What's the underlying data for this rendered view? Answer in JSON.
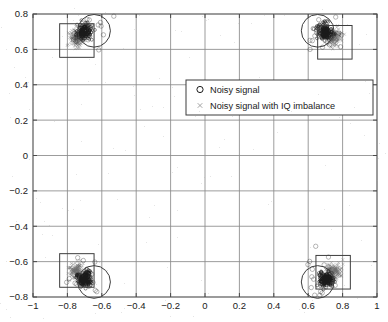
{
  "chart_data": {
    "type": "scatter",
    "title": "",
    "xlabel": "",
    "ylabel": "",
    "xlim": [
      -1,
      1
    ],
    "ylim": [
      -0.8,
      0.8
    ],
    "grid": true,
    "xticks": [
      -1,
      -0.8,
      -0.6,
      -0.4,
      -0.2,
      0,
      0.2,
      0.4,
      0.6,
      0.8,
      1
    ],
    "xticklabels": [
      "-1",
      "-0.8",
      "-0.6",
      "-0.4",
      "-0.2",
      "0",
      "0.2",
      "0.4",
      "0.6",
      "0.8",
      "1"
    ],
    "yticks": [
      -0.8,
      -0.6,
      -0.4,
      -0.2,
      0,
      0.2,
      0.4,
      0.6,
      0.8
    ],
    "yticklabels": [
      "-0.8",
      "-0.6",
      "-0.4",
      "-0.2",
      "0",
      "0.2",
      "0.4",
      "0.6",
      "0.8"
    ],
    "legend": {
      "position": "upper-center-right",
      "entries": [
        {
          "label": "Noisy signal",
          "marker": "circle",
          "color": "#1a1a1a"
        },
        {
          "label": "Noisy signal with IQ imbalance",
          "marker": "x",
          "color": "#1a1a1a"
        }
      ]
    },
    "series": [
      {
        "name": "Noisy signal",
        "marker": "circle",
        "color": "#1a1a1a",
        "constellation_centers": [
          {
            "x": -0.7,
            "y": 0.7
          },
          {
            "x": 0.7,
            "y": 0.7
          },
          {
            "x": -0.7,
            "y": -0.7
          },
          {
            "x": 0.7,
            "y": -0.7
          }
        ],
        "cluster_radius": 0.065,
        "points_per_cluster": 180
      },
      {
        "name": "Noisy signal with IQ imbalance",
        "marker": "x",
        "color": "#6f6f6f",
        "constellation_centers": [
          {
            "x": -0.745,
            "y": 0.665
          },
          {
            "x": 0.745,
            "y": 0.665
          },
          {
            "x": -0.745,
            "y": -0.655
          },
          {
            "x": 0.745,
            "y": -0.655
          }
        ],
        "cluster_radius": 0.055,
        "points_per_cluster": 150
      }
    ],
    "annotations": {
      "decision_circles": [
        {
          "cx": -0.645,
          "cy": 0.705,
          "r": 0.095
        },
        {
          "cx": 0.655,
          "cy": 0.705,
          "r": 0.095
        },
        {
          "cx": -0.645,
          "cy": -0.715,
          "r": 0.095
        },
        {
          "cx": 0.655,
          "cy": -0.715,
          "r": 0.095
        }
      ],
      "decision_rects": [
        {
          "x0": -0.845,
          "y0": 0.555,
          "x1": -0.645,
          "y1": 0.745
        },
        {
          "x0": 0.655,
          "y0": 0.545,
          "x1": 0.855,
          "y1": 0.735
        },
        {
          "x0": -0.845,
          "y0": -0.745,
          "x1": -0.645,
          "y1": -0.555
        },
        {
          "x0": 0.645,
          "y0": -0.755,
          "x1": 0.845,
          "y1": -0.565
        }
      ]
    }
  },
  "figure": {
    "axes": {
      "background": "#ffffff",
      "frame_color": "#4a4a4a",
      "grid_color": "#8a8a8a"
    }
  }
}
